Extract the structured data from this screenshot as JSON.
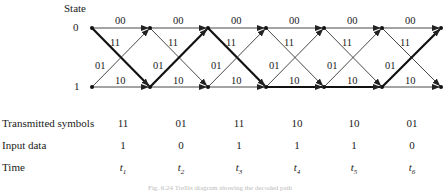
{
  "state_header": "State",
  "states": [
    "0",
    "1"
  ],
  "nodes_x": [
    92,
    150,
    208,
    266,
    324,
    382,
    441
  ],
  "y_top": 28,
  "y_bottom": 87,
  "edge_labels": {
    "s0_to_s0": "00",
    "s0_to_s1": "11",
    "s1_to_s0": "01",
    "s1_to_s1": "10"
  },
  "path": [
    {
      "from": 0,
      "to": 1
    },
    {
      "from": 1,
      "to": 0
    },
    {
      "from": 0,
      "to": 1
    },
    {
      "from": 1,
      "to": 1
    },
    {
      "from": 1,
      "to": 1
    },
    {
      "from": 1,
      "to": 0
    }
  ],
  "rows": [
    {
      "label": "Transmitted symbols",
      "values": [
        "11",
        "01",
        "11",
        "10",
        "10",
        "01"
      ]
    },
    {
      "label": "Input data",
      "values": [
        "1",
        "0",
        "1",
        "1",
        "1",
        "0"
      ]
    },
    {
      "label": "Time",
      "values": [
        "t1",
        "t2",
        "t3",
        "t4",
        "t5",
        "t6"
      ]
    }
  ],
  "time_labels": [
    {
      "base": "t",
      "sub": "1"
    },
    {
      "base": "t",
      "sub": "2"
    },
    {
      "base": "t",
      "sub": "3"
    },
    {
      "base": "t",
      "sub": "4"
    },
    {
      "base": "t",
      "sub": "5"
    },
    {
      "base": "t",
      "sub": "6"
    }
  ],
  "caption": "Fig. 6.24 Trellis diagram showing the decoded path",
  "colors": {
    "line": "#333333",
    "bold": "#111111"
  }
}
